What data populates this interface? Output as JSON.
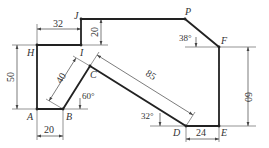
{
  "diagram": {
    "type": "engineering-drawing",
    "colors": {
      "outline": "#222222",
      "dimension": "#444444",
      "background": "#ffffff"
    },
    "points": [
      {
        "id": "A",
        "label": "A"
      },
      {
        "id": "B",
        "label": "B"
      },
      {
        "id": "C",
        "label": "C"
      },
      {
        "id": "D",
        "label": "D"
      },
      {
        "id": "E",
        "label": "E"
      },
      {
        "id": "F",
        "label": "F"
      },
      {
        "id": "P",
        "label": "P"
      },
      {
        "id": "J",
        "label": "J"
      },
      {
        "id": "I",
        "label": "I"
      },
      {
        "id": "H",
        "label": "H"
      }
    ],
    "dimensions": {
      "HI": "32",
      "JI": "20",
      "HA": "50",
      "AB": "20",
      "BC": "40",
      "CD": "85",
      "DE": "24",
      "FE": "60"
    },
    "angles": {
      "B": "60°",
      "D": "32°",
      "P": "38°"
    }
  }
}
